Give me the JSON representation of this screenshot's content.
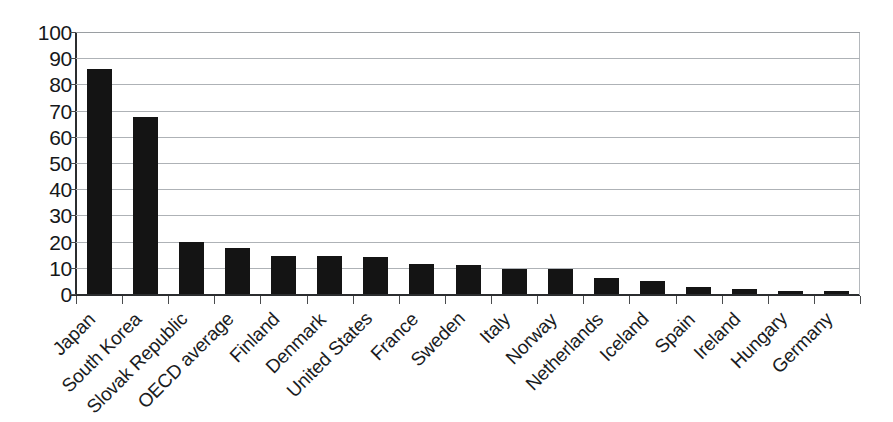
{
  "chart_data": {
    "type": "bar",
    "title": "",
    "subtitle": "",
    "xlabel": "",
    "ylabel": "",
    "ylim": [
      0,
      100
    ],
    "ytick_step": 10,
    "yticks": [
      "100",
      "90",
      "80",
      "70",
      "60",
      "50",
      "40",
      "30",
      "20",
      "10",
      "0"
    ],
    "grid": "horizontal",
    "legend": "none",
    "bar_color": "#141414",
    "categories": [
      "Japan",
      "South Korea",
      "Slovak Republic",
      "OECD average",
      "Finland",
      "Denmark",
      "United States",
      "France",
      "Sweden",
      "Italy",
      "Norway",
      "Netherlands",
      "Iceland",
      "Spain",
      "Ireland",
      "Hungary",
      "Germany"
    ],
    "values": [
      86,
      67.5,
      20,
      17.5,
      14.5,
      14.5,
      14,
      11.5,
      11,
      9.5,
      9.5,
      6,
      5,
      2.5,
      2,
      1.3,
      1.3
    ]
  },
  "axis": {
    "y_min_label": "0",
    "y_max_label": "100"
  }
}
